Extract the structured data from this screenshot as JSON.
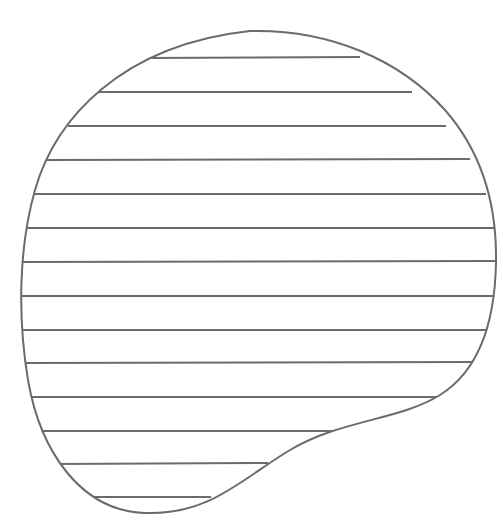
{
  "figure": {
    "stroke_color": "#6b6b6b",
    "background_color": "#ffffff",
    "stroke_width": 2,
    "outline_path": "M 250 31 C 330 29, 400 60, 445 110 C 480 150, 497 200, 496 262 C 495 320, 480 370, 440 395 C 400 420, 340 420, 290 450 C 240 480, 210 515, 145 513 C 80 511, 40 450, 28 380 C 18 320, 18 250, 35 190 C 55 120, 120 45, 250 31 Z",
    "hatch_lines": [
      {
        "y": 58,
        "x1": 152,
        "x2": 354
      },
      {
        "y": 92,
        "x1": 104,
        "x2": 406
      },
      {
        "y": 126,
        "x1": 74,
        "x2": 440
      },
      {
        "y": 160,
        "x1": 52,
        "x2": 464
      },
      {
        "y": 194,
        "x1": 38,
        "x2": 480
      },
      {
        "y": 228,
        "x1": 28,
        "x2": 491
      },
      {
        "y": 262,
        "x1": 23,
        "x2": 496
      },
      {
        "y": 296,
        "x1": 21,
        "x2": 494
      },
      {
        "y": 330,
        "x1": 22,
        "x2": 485
      },
      {
        "y": 363,
        "x1": 26,
        "x2": 468
      },
      {
        "y": 397,
        "x1": 32,
        "x2": 435
      },
      {
        "y": 431,
        "x1": 43,
        "x2": 345
      },
      {
        "y": 464,
        "x1": 60,
        "x2": 262
      },
      {
        "y": 497,
        "x1": 92,
        "x2": 205
      }
    ]
  }
}
